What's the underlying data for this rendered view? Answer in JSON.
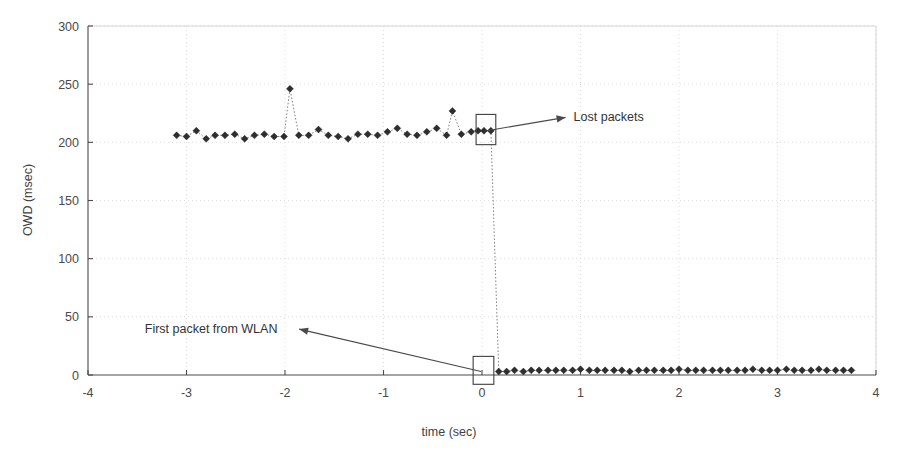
{
  "chart_data": {
    "type": "scatter",
    "title": "",
    "subtitle": "",
    "xlabel": "time (sec)",
    "ylabel": "OWD (msec)",
    "xlim": [
      -4,
      4
    ],
    "ylim": [
      0,
      300
    ],
    "xticks": [
      -4,
      -3,
      -2,
      -1,
      0,
      1,
      2,
      3,
      4
    ],
    "xtick_labels": [
      "-4",
      "-3",
      "-2",
      "-1",
      "0",
      "1",
      "2",
      "3",
      "4"
    ],
    "yticks": [
      0,
      50,
      100,
      150,
      200,
      250,
      300
    ],
    "ytick_labels": [
      "0",
      "50",
      "100",
      "150",
      "200",
      "250",
      "300"
    ],
    "grid": "dotted-light-both-axes",
    "legend": "none",
    "marker": "filled-diamond",
    "line_style": "dotted",
    "series": [
      {
        "name": "OWD",
        "x": [
          -3.1,
          -3.0,
          -2.9,
          -2.8,
          -2.71,
          -2.61,
          -2.51,
          -2.41,
          -2.31,
          -2.21,
          -2.11,
          -2.01,
          -1.95,
          -1.86,
          -1.76,
          -1.66,
          -1.56,
          -1.46,
          -1.36,
          -1.26,
          -1.16,
          -1.06,
          -0.96,
          -0.86,
          -0.76,
          -0.66,
          -0.56,
          -0.46,
          -0.36,
          -0.3,
          -0.21,
          -0.11,
          -0.04,
          0.02,
          0.09,
          0.17,
          0.25,
          0.33,
          0.42,
          0.5,
          0.58,
          0.67,
          0.75,
          0.83,
          0.92,
          1.0,
          1.09,
          1.17,
          1.25,
          1.34,
          1.42,
          1.5,
          1.59,
          1.67,
          1.75,
          1.84,
          1.92,
          2.0,
          2.09,
          2.17,
          2.25,
          2.34,
          2.42,
          2.5,
          2.59,
          2.67,
          2.75,
          2.84,
          2.92,
          3.0,
          3.09,
          3.17,
          3.25,
          3.34,
          3.42,
          3.5,
          3.59,
          3.67,
          3.75
        ],
        "y": [
          206,
          205,
          210,
          203,
          206,
          206,
          207,
          203,
          206,
          207,
          205,
          205,
          246,
          206,
          206,
          211,
          206,
          205,
          203,
          207,
          207,
          206,
          209,
          212,
          207,
          206,
          209,
          212,
          206,
          227,
          207,
          209,
          210,
          210,
          210,
          3,
          3,
          4,
          3,
          4,
          4,
          4,
          4,
          4,
          4,
          5,
          4,
          4,
          4,
          4,
          4,
          3,
          4,
          4,
          4,
          4,
          4,
          5,
          4,
          4,
          4,
          4,
          4,
          4,
          4,
          4,
          5,
          4,
          4,
          4,
          5,
          4,
          4,
          4,
          5,
          4,
          4,
          4,
          4
        ]
      }
    ],
    "annotations": [
      {
        "id": "lost-packets",
        "text": "Lost packets",
        "text_x": 0.93,
        "text_y": 218,
        "target_x": 0.05,
        "target_y": 210,
        "highlight_box": {
          "x0": -0.06,
          "x1": 0.14,
          "y0": 198,
          "y1": 224
        }
      },
      {
        "id": "first-packet-from-wlan",
        "text": "First packet from WLAN",
        "text_x": -2.75,
        "text_y": 36,
        "target_x": -0.01,
        "target_y": 3,
        "highlight_box": {
          "x0": -0.09,
          "x1": 0.12,
          "y0": -8,
          "y1": 16
        }
      }
    ]
  },
  "colors": {
    "background": "#ffffff",
    "axis": "#4a4a4a",
    "frame": "#d6d6d6",
    "grid": "#d8d8d8",
    "marker": "#2e2e2e",
    "series_line": "#6e6e6e",
    "annotation": "#333333"
  }
}
